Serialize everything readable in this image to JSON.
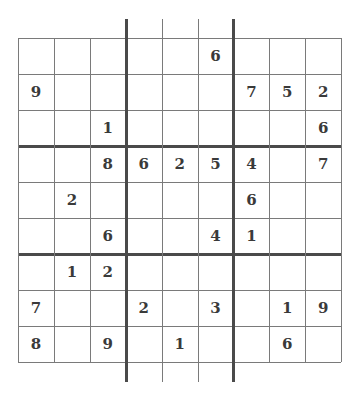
{
  "puzzle": {
    "type": "sudoku",
    "size": 9,
    "grid": [
      [
        "",
        "",
        "",
        "",
        "",
        "6",
        "",
        "",
        ""
      ],
      [
        "9",
        "",
        "",
        "",
        "",
        "",
        "7",
        "5",
        "2"
      ],
      [
        "",
        "",
        "1",
        "",
        "",
        "",
        "",
        "",
        "6"
      ],
      [
        "",
        "",
        "8",
        "6",
        "2",
        "5",
        "4",
        "",
        "7"
      ],
      [
        "",
        "2",
        "",
        "",
        "",
        "",
        "6",
        "",
        ""
      ],
      [
        "",
        "",
        "6",
        "",
        "",
        "4",
        "1",
        "",
        ""
      ],
      [
        "",
        "1",
        "2",
        "",
        "",
        "",
        "",
        "",
        ""
      ],
      [
        "7",
        "",
        "",
        "2",
        "",
        "3",
        "",
        "1",
        "9"
      ],
      [
        "8",
        "",
        "9",
        "",
        "1",
        "",
        "",
        "6",
        ""
      ]
    ]
  },
  "colors": {
    "grid_line": "#7a7a7a",
    "box_line": "#4a4a4a",
    "digit": "#3a3a3a",
    "background": "#ffffff"
  }
}
